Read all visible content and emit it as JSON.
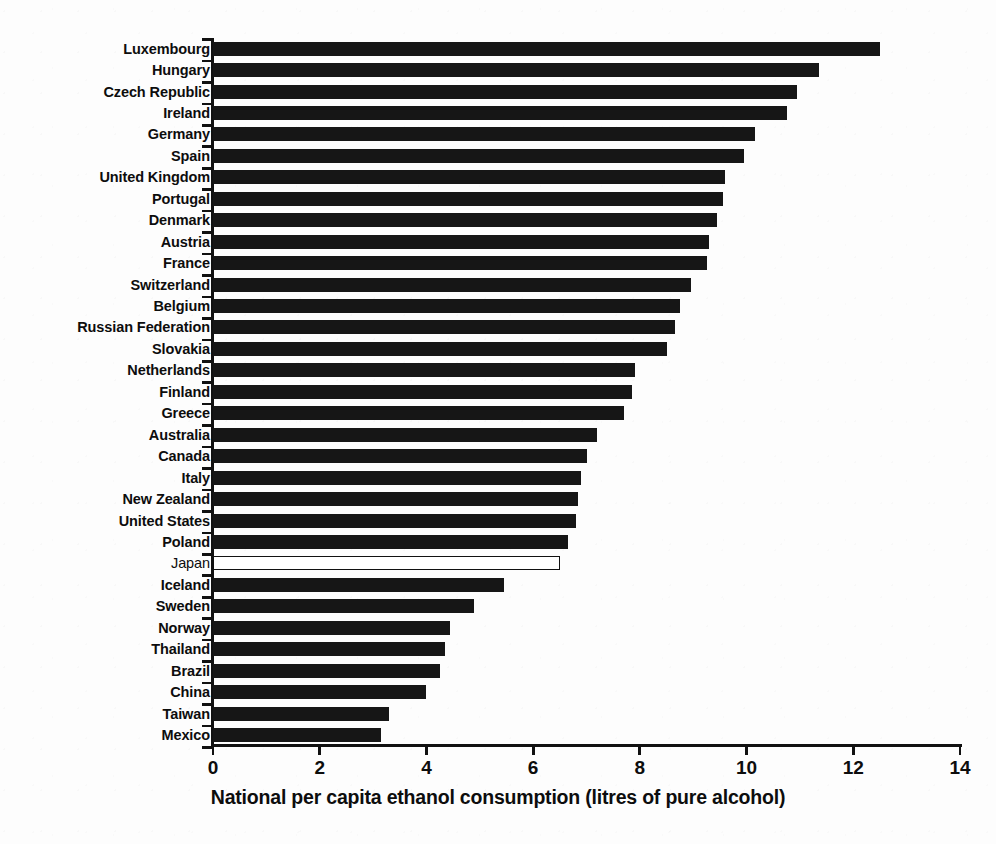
{
  "chart_data": {
    "type": "bar",
    "orientation": "horizontal",
    "title": "",
    "xlabel": "National per capita ethanol consumption (litres of pure alcohol)",
    "ylabel": "",
    "xlim": [
      0,
      14
    ],
    "xticks": [
      0,
      2,
      4,
      6,
      8,
      10,
      12,
      14
    ],
    "xticklabels": [
      "0",
      "2",
      "4",
      "6",
      "8",
      "10",
      "12",
      "14"
    ],
    "grid": false,
    "legend": null,
    "highlight_category": "Japan",
    "highlight_style": "hollow-white-bar-with-black-outline",
    "series_color": "#161616",
    "categories": [
      "Luxembourg",
      "Hungary",
      "Czech Republic",
      "Ireland",
      "Germany",
      "Spain",
      "United Kingdom",
      "Portugal",
      "Denmark",
      "Austria",
      "France",
      "Switzerland",
      "Belgium",
      "Russian Federation",
      "Slovakia",
      "Netherlands",
      "Finland",
      "Greece",
      "Australia",
      "Canada",
      "Italy",
      "New Zealand",
      "United States",
      "Poland",
      "Japan",
      "Iceland",
      "Sweden",
      "Norway",
      "Thailand",
      "Brazil",
      "China",
      "Taiwan",
      "Mexico"
    ],
    "values": [
      12.5,
      11.35,
      10.95,
      10.75,
      10.15,
      9.95,
      9.6,
      9.55,
      9.45,
      9.3,
      9.25,
      8.95,
      8.75,
      8.65,
      8.5,
      7.9,
      7.85,
      7.7,
      7.2,
      7.0,
      6.9,
      6.85,
      6.8,
      6.65,
      6.5,
      5.45,
      4.9,
      4.45,
      4.35,
      4.25,
      4.0,
      3.3,
      3.15
    ],
    "bars": [
      {
        "label": "Luxembourg",
        "value": 12.5,
        "highlighted": false
      },
      {
        "label": "Hungary",
        "value": 11.35,
        "highlighted": false
      },
      {
        "label": "Czech Republic",
        "value": 10.95,
        "highlighted": false
      },
      {
        "label": "Ireland",
        "value": 10.75,
        "highlighted": false
      },
      {
        "label": "Germany",
        "value": 10.15,
        "highlighted": false
      },
      {
        "label": "Spain",
        "value": 9.95,
        "highlighted": false
      },
      {
        "label": "United Kingdom",
        "value": 9.6,
        "highlighted": false
      },
      {
        "label": "Portugal",
        "value": 9.55,
        "highlighted": false
      },
      {
        "label": "Denmark",
        "value": 9.45,
        "highlighted": false
      },
      {
        "label": "Austria",
        "value": 9.3,
        "highlighted": false
      },
      {
        "label": "France",
        "value": 9.25,
        "highlighted": false
      },
      {
        "label": "Switzerland",
        "value": 8.95,
        "highlighted": false
      },
      {
        "label": "Belgium",
        "value": 8.75,
        "highlighted": false
      },
      {
        "label": "Russian Federation",
        "value": 8.65,
        "highlighted": false
      },
      {
        "label": "Slovakia",
        "value": 8.5,
        "highlighted": false
      },
      {
        "label": "Netherlands",
        "value": 7.9,
        "highlighted": false
      },
      {
        "label": "Finland",
        "value": 7.85,
        "highlighted": false
      },
      {
        "label": "Greece",
        "value": 7.7,
        "highlighted": false
      },
      {
        "label": "Australia",
        "value": 7.2,
        "highlighted": false
      },
      {
        "label": "Canada",
        "value": 7.0,
        "highlighted": false
      },
      {
        "label": "Italy",
        "value": 6.9,
        "highlighted": false
      },
      {
        "label": "New Zealand",
        "value": 6.85,
        "highlighted": false
      },
      {
        "label": "United States",
        "value": 6.8,
        "highlighted": false
      },
      {
        "label": "Poland",
        "value": 6.65,
        "highlighted": false
      },
      {
        "label": "Japan",
        "value": 6.5,
        "highlighted": true
      },
      {
        "label": "Iceland",
        "value": 5.45,
        "highlighted": false
      },
      {
        "label": "Sweden",
        "value": 4.9,
        "highlighted": false
      },
      {
        "label": "Norway",
        "value": 4.45,
        "highlighted": false
      },
      {
        "label": "Thailand",
        "value": 4.35,
        "highlighted": false
      },
      {
        "label": "Brazil",
        "value": 4.25,
        "highlighted": false
      },
      {
        "label": "China",
        "value": 4.0,
        "highlighted": false
      },
      {
        "label": "Taiwan",
        "value": 3.3,
        "highlighted": false
      },
      {
        "label": "Mexico",
        "value": 3.15,
        "highlighted": false
      }
    ]
  }
}
